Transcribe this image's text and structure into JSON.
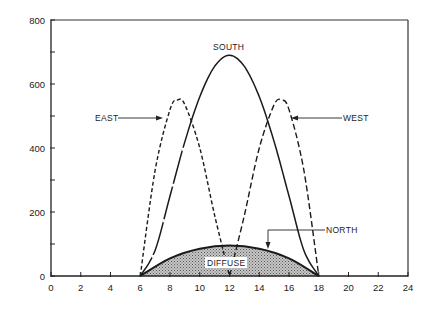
{
  "chart_data": {
    "type": "line",
    "title": "",
    "xlabel": "",
    "ylabel": "",
    "xlim": [
      0,
      24
    ],
    "ylim": [
      0,
      800
    ],
    "x_ticks": [
      0,
      2,
      4,
      6,
      8,
      10,
      12,
      14,
      16,
      18,
      20,
      22,
      24
    ],
    "y_ticks_labeled": [
      0,
      200,
      400,
      600,
      800
    ],
    "y_ticks_minor": [
      100,
      300,
      500,
      700
    ],
    "grid": false,
    "legend": "inline labels with leader arrows",
    "series": [
      {
        "name": "SOUTH",
        "style": "solid/long-dash",
        "x": [
          6,
          7,
          8,
          9,
          10,
          11,
          12,
          13,
          14,
          15,
          16,
          17,
          18
        ],
        "y": [
          0,
          80,
          250,
          420,
          560,
          655,
          690,
          655,
          560,
          420,
          250,
          80,
          0
        ]
      },
      {
        "name": "EAST",
        "style": "short-dash",
        "x": [
          6,
          7,
          8,
          8.5,
          9,
          10,
          11,
          12
        ],
        "y": [
          0,
          330,
          520,
          550,
          535,
          400,
          190,
          0
        ]
      },
      {
        "name": "WEST",
        "style": "short-dash",
        "x": [
          12,
          13,
          14,
          15,
          15.5,
          16,
          17,
          18
        ],
        "y": [
          0,
          190,
          400,
          535,
          550,
          520,
          330,
          0
        ]
      },
      {
        "name": "NORTH",
        "style": "solid",
        "x": [
          6,
          8,
          10,
          12,
          14,
          16,
          18
        ],
        "y": [
          0,
          55,
          85,
          95,
          85,
          55,
          0
        ]
      }
    ],
    "filled_region": {
      "name": "DIFFUSE",
      "under_series": "NORTH",
      "pattern": "stippled gray"
    },
    "annotations": [
      "SOUTH",
      "EAST",
      "WEST",
      "NORTH",
      "DIFFUSE"
    ]
  },
  "labels": {
    "south": "SOUTH",
    "east": "EAST",
    "west": "WEST",
    "north": "NORTH",
    "diffuse": "DIFFUSE"
  },
  "axis": {
    "x": [
      "0",
      "2",
      "4",
      "6",
      "8",
      "10",
      "12",
      "14",
      "16",
      "18",
      "20",
      "22",
      "24"
    ],
    "y": [
      "0",
      "200",
      "400",
      "600",
      "800"
    ]
  }
}
